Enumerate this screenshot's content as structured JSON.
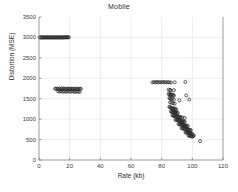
{
  "chart_data": {
    "type": "scatter",
    "title": "Mobile",
    "xlabel": "Rate (kb)",
    "ylabel": "Distortion (MSE)",
    "xlim": [
      0,
      120
    ],
    "ylim": [
      0,
      3500
    ],
    "xticks": [
      0,
      20,
      40,
      60,
      80,
      100,
      120
    ],
    "yticks": [
      0,
      500,
      1000,
      1500,
      2000,
      2500,
      3000,
      3500
    ],
    "grid": true,
    "legend": "none",
    "marker": "open-circle",
    "marker_color": "#2a2a2a",
    "grid_color": "#e6e6e6",
    "axis_color": "#808080",
    "series": [
      {
        "name": "rate-distortion points",
        "points": [
          [
            0.4,
            3000
          ],
          [
            0.9,
            3000
          ],
          [
            1.4,
            3000
          ],
          [
            1.9,
            3000
          ],
          [
            2.4,
            3000
          ],
          [
            2.9,
            3000
          ],
          [
            3.4,
            3000
          ],
          [
            3.9,
            3000
          ],
          [
            4.4,
            3000
          ],
          [
            4.9,
            3000
          ],
          [
            5.4,
            3000
          ],
          [
            5.9,
            3000
          ],
          [
            6.4,
            3000
          ],
          [
            6.9,
            3000
          ],
          [
            7.4,
            3000
          ],
          [
            7.9,
            3000
          ],
          [
            8.4,
            3000
          ],
          [
            8.9,
            3000
          ],
          [
            9.4,
            3000
          ],
          [
            9.9,
            3000
          ],
          [
            10.4,
            3000
          ],
          [
            10.9,
            3000
          ],
          [
            11.4,
            3000
          ],
          [
            11.9,
            3000
          ],
          [
            12.4,
            3000
          ],
          [
            12.9,
            3000
          ],
          [
            13.4,
            3000
          ],
          [
            13.9,
            3000
          ],
          [
            14.4,
            3000
          ],
          [
            14.9,
            3000
          ],
          [
            15.4,
            3000
          ],
          [
            15.9,
            3000
          ],
          [
            16.4,
            3000
          ],
          [
            16.9,
            3005
          ],
          [
            17.4,
            3000
          ],
          [
            17.9,
            3005
          ],
          [
            18.4,
            3000
          ],
          [
            18.9,
            3010
          ],
          [
            19.4,
            3000
          ],
          [
            10.5,
            1745
          ],
          [
            11.2,
            1740
          ],
          [
            11.9,
            1750
          ],
          [
            12.6,
            1735
          ],
          [
            13.3,
            1745
          ],
          [
            14.0,
            1730
          ],
          [
            14.7,
            1755
          ],
          [
            15.4,
            1740
          ],
          [
            16.1,
            1750
          ],
          [
            16.8,
            1735
          ],
          [
            17.5,
            1745
          ],
          [
            18.2,
            1730
          ],
          [
            18.9,
            1750
          ],
          [
            19.6,
            1740
          ],
          [
            20.3,
            1735
          ],
          [
            21.0,
            1750
          ],
          [
            21.7,
            1740
          ],
          [
            22.4,
            1745
          ],
          [
            23.1,
            1730
          ],
          [
            23.8,
            1750
          ],
          [
            24.5,
            1740
          ],
          [
            25.2,
            1735
          ],
          [
            25.9,
            1745
          ],
          [
            26.6,
            1738
          ],
          [
            27.3,
            1742
          ],
          [
            12.5,
            1680
          ],
          [
            13.5,
            1675
          ],
          [
            14.5,
            1685
          ],
          [
            15.5,
            1670
          ],
          [
            16.5,
            1680
          ],
          [
            17.5,
            1672
          ],
          [
            18.5,
            1685
          ],
          [
            19.5,
            1675
          ],
          [
            20.5,
            1670
          ],
          [
            21.5,
            1682
          ],
          [
            22.5,
            1676
          ],
          [
            23.5,
            1668
          ],
          [
            24.5,
            1678
          ],
          [
            25.5,
            1672
          ],
          [
            26.5,
            1665
          ],
          [
            74.0,
            1900
          ],
          [
            75.0,
            1905
          ],
          [
            76.0,
            1900
          ],
          [
            77.0,
            1910
          ],
          [
            78.0,
            1900
          ],
          [
            79.0,
            1905
          ],
          [
            80.0,
            1900
          ],
          [
            81.0,
            1908
          ],
          [
            82.0,
            1902
          ],
          [
            83.0,
            1900
          ],
          [
            84.0,
            1905
          ],
          [
            85.0,
            1900
          ],
          [
            86.0,
            1895
          ],
          [
            88.5,
            1900
          ],
          [
            95.5,
            1910
          ],
          [
            84.5,
            1720
          ],
          [
            85.5,
            1715
          ],
          [
            86.0,
            1700
          ],
          [
            88.0,
            1710
          ],
          [
            84.5,
            1620
          ],
          [
            85.0,
            1600
          ],
          [
            85.5,
            1610
          ],
          [
            86.0,
            1590
          ],
          [
            86.5,
            1605
          ],
          [
            87.0,
            1585
          ],
          [
            87.5,
            1595
          ],
          [
            88.0,
            1575
          ],
          [
            96.0,
            1580
          ],
          [
            85.0,
            1520
          ],
          [
            85.5,
            1505
          ],
          [
            86.0,
            1490
          ],
          [
            87.0,
            1500
          ],
          [
            88.0,
            1480
          ],
          [
            91.5,
            1460
          ],
          [
            98.0,
            1480
          ],
          [
            85.5,
            1410
          ],
          [
            86.5,
            1400
          ],
          [
            87.5,
            1390
          ],
          [
            88.5,
            1380
          ],
          [
            85.0,
            1300
          ],
          [
            85.5,
            1290
          ],
          [
            86.0,
            1280
          ],
          [
            86.5,
            1270
          ],
          [
            87.0,
            1260
          ],
          [
            87.5,
            1250
          ],
          [
            88.0,
            1265
          ],
          [
            88.5,
            1240
          ],
          [
            89.0,
            1255
          ],
          [
            89.5,
            1230
          ],
          [
            86.0,
            1190
          ],
          [
            86.5,
            1180
          ],
          [
            87.0,
            1170
          ],
          [
            87.5,
            1185
          ],
          [
            88.0,
            1160
          ],
          [
            88.5,
            1175
          ],
          [
            89.0,
            1150
          ],
          [
            89.5,
            1165
          ],
          [
            90.0,
            1140
          ],
          [
            90.5,
            1155
          ],
          [
            87.0,
            1095
          ],
          [
            87.5,
            1085
          ],
          [
            88.0,
            1075
          ],
          [
            88.5,
            1090
          ],
          [
            89.0,
            1065
          ],
          [
            89.5,
            1080
          ],
          [
            90.0,
            1055
          ],
          [
            90.5,
            1070
          ],
          [
            91.0,
            1045
          ],
          [
            91.5,
            1060
          ],
          [
            92.0,
            1035
          ],
          [
            92.5,
            1050
          ],
          [
            93.5,
            1040
          ],
          [
            95.0,
            1030
          ],
          [
            89.0,
            985
          ],
          [
            89.5,
            975
          ],
          [
            90.0,
            990
          ],
          [
            90.5,
            965
          ],
          [
            91.0,
            980
          ],
          [
            91.5,
            955
          ],
          [
            92.0,
            970
          ],
          [
            92.5,
            945
          ],
          [
            93.0,
            960
          ],
          [
            93.5,
            935
          ],
          [
            94.0,
            950
          ],
          [
            94.5,
            925
          ],
          [
            95.0,
            940
          ],
          [
            91.0,
            880
          ],
          [
            91.5,
            870
          ],
          [
            92.0,
            885
          ],
          [
            92.5,
            860
          ],
          [
            93.0,
            875
          ],
          [
            93.5,
            850
          ],
          [
            94.0,
            865
          ],
          [
            94.5,
            840
          ],
          [
            95.0,
            855
          ],
          [
            95.5,
            830
          ],
          [
            96.0,
            845
          ],
          [
            96.5,
            820
          ],
          [
            97.0,
            835
          ],
          [
            93.0,
            780
          ],
          [
            93.5,
            770
          ],
          [
            94.0,
            785
          ],
          [
            94.5,
            760
          ],
          [
            95.0,
            775
          ],
          [
            95.5,
            750
          ],
          [
            96.0,
            765
          ],
          [
            96.5,
            740
          ],
          [
            97.0,
            755
          ],
          [
            97.5,
            730
          ],
          [
            98.0,
            745
          ],
          [
            98.5,
            720
          ],
          [
            99.0,
            735
          ],
          [
            95.5,
            680
          ],
          [
            96.0,
            670
          ],
          [
            96.5,
            685
          ],
          [
            97.0,
            660
          ],
          [
            97.5,
            675
          ],
          [
            98.0,
            650
          ],
          [
            98.5,
            665
          ],
          [
            99.0,
            640
          ],
          [
            99.5,
            655
          ],
          [
            100.0,
            630
          ],
          [
            97.5,
            600
          ],
          [
            98.0,
            590
          ],
          [
            98.5,
            605
          ],
          [
            99.0,
            580
          ],
          [
            99.5,
            595
          ],
          [
            100.0,
            570
          ],
          [
            100.5,
            585
          ],
          [
            101.0,
            600
          ],
          [
            105.0,
            460
          ]
        ]
      }
    ]
  }
}
